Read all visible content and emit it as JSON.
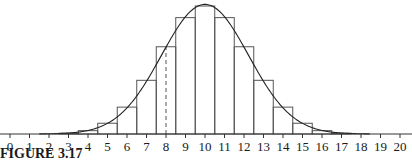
{
  "chart_data": {
    "type": "bar",
    "title": "",
    "caption": "FIGURE 3.17",
    "xlabel": "",
    "ylabel": "",
    "categories": [
      0,
      1,
      2,
      3,
      4,
      5,
      6,
      7,
      8,
      9,
      10,
      11,
      12,
      13,
      14,
      15,
      16,
      17,
      18,
      19,
      20
    ],
    "tick_labels": [
      "0",
      "1",
      "2",
      "3",
      "4",
      "5",
      "6",
      "7",
      "8",
      "9",
      "10",
      "11",
      "12",
      "13",
      "14",
      "15",
      "16",
      "17",
      "18",
      "19",
      "20"
    ],
    "values": [
      0.0,
      0.0,
      0.0002,
      0.0011,
      0.0046,
      0.0148,
      0.037,
      0.0739,
      0.1201,
      0.1602,
      0.1762,
      0.1602,
      0.1201,
      0.0739,
      0.037,
      0.0148,
      0.0046,
      0.0011,
      0.0002,
      0.0,
      0.0
    ],
    "overlay_curve": {
      "type": "normal",
      "mean": 10,
      "sd": 2.236
    },
    "dashed_marker_x": 8,
    "xlim": [
      0,
      20
    ],
    "ylim": [
      0,
      0.18
    ],
    "grid": false,
    "legend": null,
    "colors": {
      "bar_stroke": "#555555",
      "curve": "#222222",
      "axis": "#333333",
      "text": "#1a1a1a",
      "dashed": "#555555"
    }
  }
}
